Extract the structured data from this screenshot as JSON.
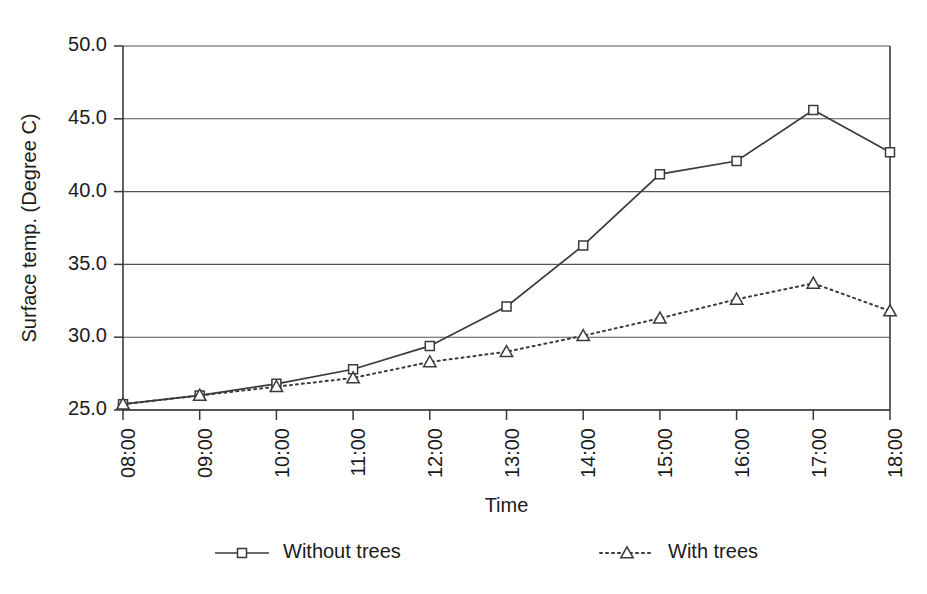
{
  "chart_data": {
    "type": "line",
    "title": "",
    "xlabel": "Time",
    "ylabel": "Surface temp. (Degree C)",
    "categories": [
      "08:00",
      "09:00",
      "10:00",
      "11:00",
      "12:00",
      "13:00",
      "14:00",
      "15:00",
      "16:00",
      "17:00",
      "18:00"
    ],
    "ylim": [
      25.0,
      50.0
    ],
    "yticks": [
      "25.0",
      "30.0",
      "35.0",
      "40.0",
      "45.0",
      "50.0"
    ],
    "ytick_values": [
      25.0,
      30.0,
      35.0,
      40.0,
      45.0,
      50.0
    ],
    "grid": true,
    "legend_position": "bottom",
    "series": [
      {
        "name": "Without trees",
        "marker": "square",
        "linestyle": "solid",
        "color": "#3a3a3a",
        "values": [
          25.4,
          26.0,
          26.8,
          27.8,
          29.4,
          32.1,
          36.3,
          41.2,
          42.1,
          45.6,
          42.7
        ]
      },
      {
        "name": "With trees",
        "marker": "triangle",
        "linestyle": "dotted",
        "color": "#3a3a3a",
        "values": [
          25.4,
          26.0,
          26.6,
          27.2,
          28.3,
          29.0,
          30.1,
          31.3,
          32.6,
          33.7,
          31.8
        ]
      }
    ]
  },
  "legend": {
    "items": [
      {
        "label": "Without trees",
        "marker": "square-marker",
        "style": "solid-line"
      },
      {
        "label": "With trees",
        "marker": "triangle-marker",
        "style": "dotted-line"
      }
    ]
  }
}
